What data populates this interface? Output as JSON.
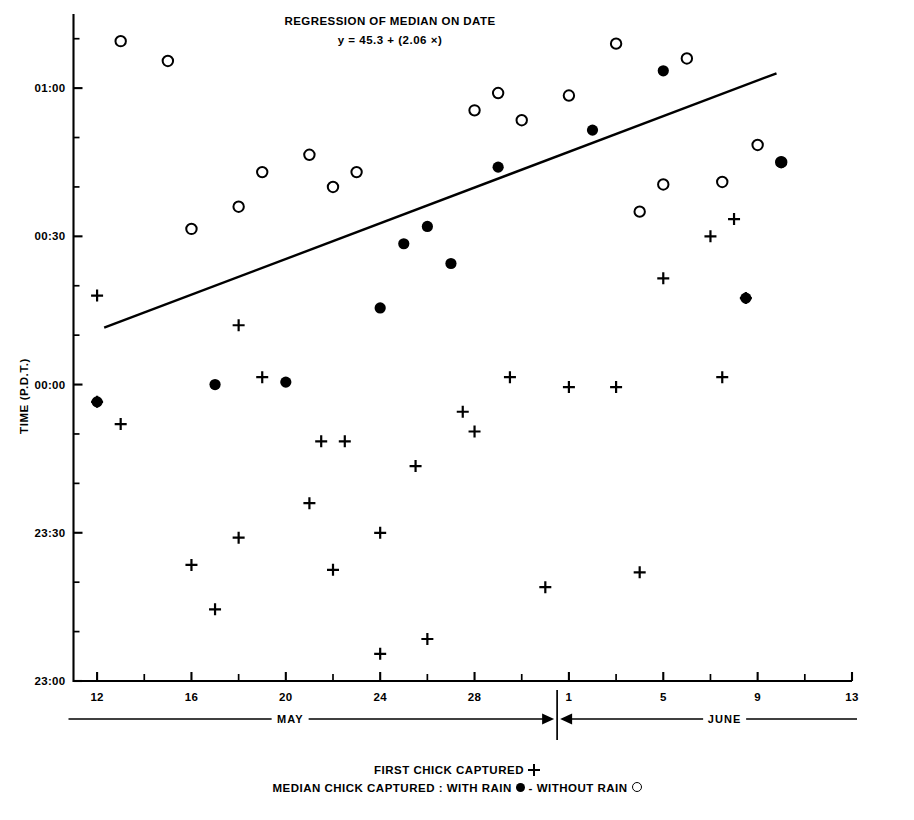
{
  "title": {
    "line1": "REGRESSION OF MEDIAN ON DATE",
    "line2": "y = 45.3 + (2.06 ×)"
  },
  "axes": {
    "ylabel": "TIME (P.D.T.)",
    "ytick_labels": [
      "01:00",
      "00:30",
      "00:00",
      "23:30",
      "23:00"
    ],
    "xtick_labels": [
      "12",
      "16",
      "20",
      "24",
      "28",
      "1",
      "5",
      "9",
      "13"
    ],
    "months": [
      "MAY",
      "JUNE"
    ]
  },
  "legend": {
    "row1_label": "FIRST CHICK CAPTURED",
    "row2_label": "MEDIAN CHICK CAPTURED :",
    "row2_with_rain": "WITH RAIN",
    "row2_sep": "-",
    "row2_without_rain": "WITHOUT RAIN"
  },
  "chart_data": {
    "type": "scatter",
    "title": "REGRESSION OF MEDIAN ON DATE",
    "subtitle": "y = 45.3 + (2.06 ×)",
    "xlabel": "",
    "ylabel": "TIME (P.D.T.)",
    "grid": false,
    "legend_position": "below",
    "xlim": [
      11,
      44
    ],
    "ylim": [
      -60,
      75
    ],
    "x_unit": "day-of-season (May 12 = 12, June 1 = 32)",
    "y_unit": "minutes relative to 00:00 P.D.T.",
    "x_ticks": [
      12,
      16,
      20,
      24,
      28,
      32,
      36,
      40,
      44
    ],
    "x_tick_labels": [
      "12",
      "16",
      "20",
      "24",
      "28",
      "1",
      "5",
      "9",
      "13"
    ],
    "y_ticks": [
      60,
      30,
      0,
      -30,
      -60
    ],
    "y_tick_labels": [
      "01:00",
      "00:30",
      "00:00",
      "23:30",
      "23:00"
    ],
    "y_minor_tick_step": 10,
    "month_divider_x": 31.5,
    "regression_line": {
      "label": "y = 45.3 + (2.06 ×)",
      "intercept": 45.3,
      "slope": 2.06,
      "x_start": 12.3,
      "y_start": 11.5,
      "x_end": 40.8,
      "y_end": 63.0
    },
    "series": [
      {
        "name": "MEDIAN CHICK CAPTURED : WITHOUT RAIN",
        "marker": "open-circle",
        "points": [
          [
            13.0,
            69.5
          ],
          [
            15.0,
            65.5
          ],
          [
            16.0,
            31.5
          ],
          [
            18.0,
            36.0
          ],
          [
            19.0,
            43.0
          ],
          [
            21.0,
            46.5
          ],
          [
            22.0,
            40.0
          ],
          [
            23.0,
            43.0
          ],
          [
            28.0,
            55.5
          ],
          [
            29.0,
            59.0
          ],
          [
            30.0,
            53.5
          ],
          [
            32.0,
            58.5
          ],
          [
            34.0,
            69.0
          ],
          [
            35.0,
            35.0
          ],
          [
            36.0,
            40.5
          ],
          [
            37.0,
            66.0
          ],
          [
            38.5,
            41.0
          ],
          [
            40.0,
            48.5
          ],
          [
            41.0,
            45.0
          ]
        ]
      },
      {
        "name": "MEDIAN CHICK CAPTURED : WITH RAIN",
        "marker": "filled-circle",
        "points": [
          [
            12.0,
            -3.5
          ],
          [
            17.0,
            0.0
          ],
          [
            20.0,
            0.5
          ],
          [
            24.0,
            15.5
          ],
          [
            25.0,
            28.5
          ],
          [
            26.0,
            32.0
          ],
          [
            27.0,
            24.5
          ],
          [
            29.0,
            44.0
          ],
          [
            33.0,
            51.5
          ],
          [
            36.0,
            63.5
          ],
          [
            41.0,
            45.0
          ],
          [
            39.5,
            17.5
          ]
        ]
      },
      {
        "name": "FIRST CHICK CAPTURED",
        "marker": "plus",
        "points": [
          [
            12.0,
            -3.5
          ],
          [
            13.0,
            -8.0
          ],
          [
            12.0,
            18.0
          ],
          [
            16.0,
            -36.5
          ],
          [
            17.0,
            -45.5
          ],
          [
            18.0,
            12.0
          ],
          [
            18.0,
            -31.0
          ],
          [
            19.0,
            1.5
          ],
          [
            21.0,
            -24.0
          ],
          [
            21.5,
            -11.5
          ],
          [
            22.5,
            -11.5
          ],
          [
            22.0,
            -37.5
          ],
          [
            24.0,
            -30.0
          ],
          [
            24.0,
            -54.5
          ],
          [
            25.5,
            -16.5
          ],
          [
            26.0,
            -51.5
          ],
          [
            27.5,
            -5.5
          ],
          [
            28.0,
            -9.5
          ],
          [
            29.5,
            1.5
          ],
          [
            31.0,
            -41.0
          ],
          [
            32.0,
            -0.5
          ],
          [
            34.0,
            -0.5
          ],
          [
            35.0,
            -38.0
          ],
          [
            36.0,
            21.5
          ],
          [
            38.0,
            30.0
          ],
          [
            39.0,
            33.5
          ],
          [
            39.5,
            17.5
          ],
          [
            38.5,
            1.5
          ]
        ]
      }
    ]
  }
}
